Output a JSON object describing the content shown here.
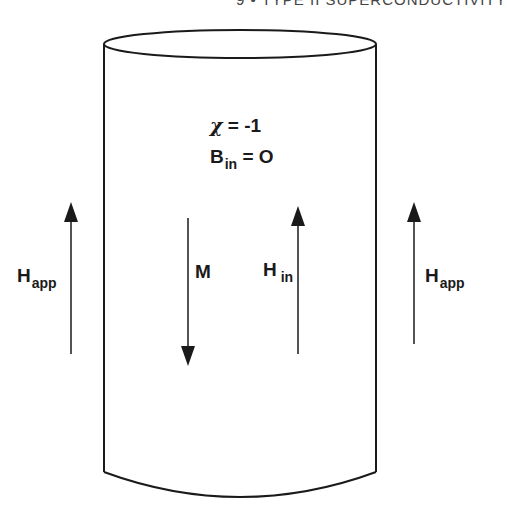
{
  "header": {
    "running_head": "9 • TYPE II SUPERCONDUCTIVITY"
  },
  "diagram": {
    "equations": {
      "susceptibility": {
        "symbol": "χ",
        "rest": " = -1"
      },
      "internal_field": {
        "symbol": "B",
        "subscript": "in",
        "rest": " = O"
      }
    },
    "arrows": [
      {
        "id": "h-app-left",
        "label": "H",
        "subscript": "app",
        "direction": "up"
      },
      {
        "id": "magnetization",
        "label": "M",
        "subscript": "",
        "direction": "down"
      },
      {
        "id": "h-in",
        "label": "H",
        "subscript": "in",
        "direction": "up"
      },
      {
        "id": "h-app-right",
        "label": "H",
        "subscript": "app",
        "direction": "up"
      }
    ],
    "colors": {
      "stroke": "#1a1a1a",
      "background": "#ffffff"
    }
  }
}
